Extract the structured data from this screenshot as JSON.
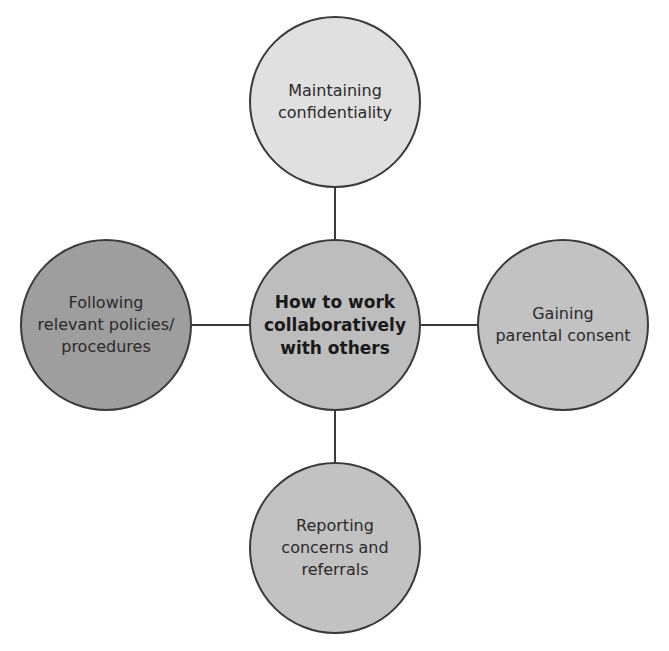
{
  "diagram": {
    "type": "hub-and-spoke",
    "center": {
      "label": "How to work\ncollaboratively\nwith others",
      "fill": "#bdbdbd",
      "cx": 335,
      "cy": 325
    },
    "nodes": [
      {
        "id": "top",
        "label": "Maintaining\nconfidentiality",
        "fill": "#e0e0e0",
        "cx": 335,
        "cy": 102
      },
      {
        "id": "left",
        "label": "Following\nrelevant policies/\nprocedures",
        "fill": "#9e9e9e",
        "cx": 106,
        "cy": 325
      },
      {
        "id": "right",
        "label": "Gaining\nparental consent",
        "fill": "#c2c2c2",
        "cx": 563,
        "cy": 325
      },
      {
        "id": "bottom",
        "label": "Reporting\nconcerns and\nreferrals",
        "fill": "#c2c2c2",
        "cx": 335,
        "cy": 548
      }
    ],
    "stroke": "#3a3a3a",
    "radius": 86
  }
}
